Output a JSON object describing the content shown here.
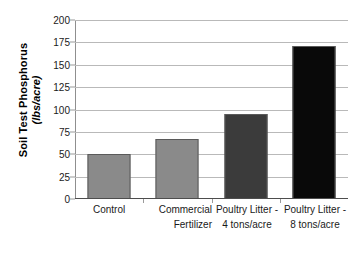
{
  "chart_data": {
    "type": "bar",
    "title": "",
    "subtitle": "",
    "xlabel": "",
    "ylabel": "Soil Test Phosphorus (lbs/acre)",
    "ylabel_line1": "Soil Test Phosphorus",
    "ylabel_line2": "(lbs/acre)",
    "categories": [
      "Control",
      "Commercial Fertilizer",
      "Poultry Litter - 4 tons/acre",
      "Poultry Litter - 8 tons/acre"
    ],
    "category_lines": [
      {
        "l1": "Control",
        "l2": ""
      },
      {
        "l1": "Commercial",
        "l2": "Fertilizer"
      },
      {
        "l1": "Poultry Litter -",
        "l2": "4 tons/acre"
      },
      {
        "l1": "Poultry Litter -",
        "l2": "8 tons/acre"
      }
    ],
    "values": [
      50,
      67,
      95,
      171
    ],
    "ylim": [
      0,
      200
    ],
    "ytick_labels": [
      "0",
      "25",
      "50",
      "75",
      "100",
      "125",
      "150",
      "175",
      "200"
    ],
    "ytick_values": [
      0,
      25,
      50,
      75,
      100,
      125,
      150,
      175,
      200
    ],
    "grid": true,
    "legend": "none",
    "bar_colors": [
      "#8a8a8a",
      "#8a8a8a",
      "#3b3b3b",
      "#090909"
    ],
    "bar_border_color": "#5a5a5a",
    "gridline_color": "#b9b9b9",
    "axis_color": "#4d4d4d",
    "background": "#ffffff"
  }
}
